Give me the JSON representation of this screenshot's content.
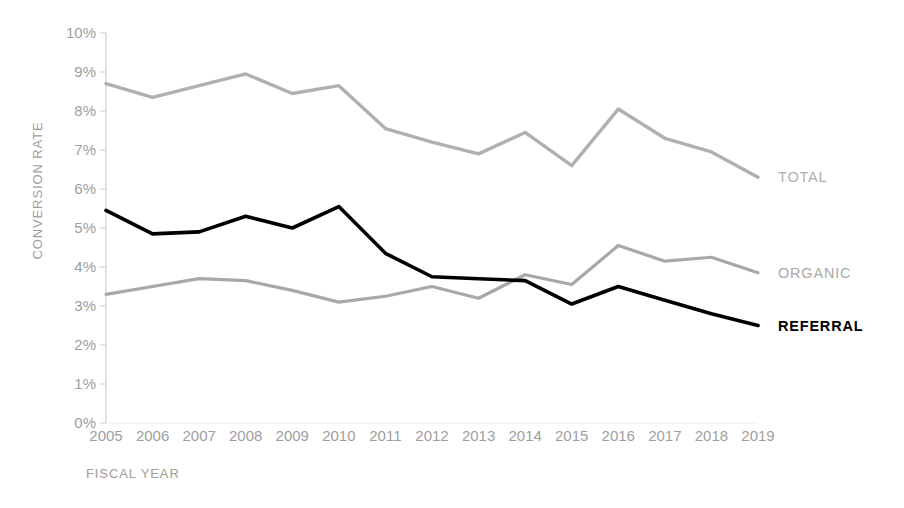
{
  "chart_data": {
    "type": "line",
    "title": "",
    "xlabel": "FISCAL YEAR",
    "ylabel": "CONVERSION RATE",
    "categories": [
      "2005",
      "2006",
      "2007",
      "2008",
      "2009",
      "2010",
      "2011",
      "2012",
      "2013",
      "2014",
      "2015",
      "2016",
      "2017",
      "2018",
      "2019"
    ],
    "x": [
      2005,
      2006,
      2007,
      2008,
      2009,
      2010,
      2011,
      2012,
      2013,
      2014,
      2015,
      2016,
      2017,
      2018,
      2019
    ],
    "ylim": [
      0,
      10
    ],
    "y_tick_labels": [
      "0%",
      "1%",
      "2%",
      "3%",
      "4%",
      "5%",
      "6%",
      "7%",
      "8%",
      "9%",
      "10%"
    ],
    "y_tick_values": [
      0,
      1,
      2,
      3,
      4,
      5,
      6,
      7,
      8,
      9,
      10
    ],
    "y_unit": "%",
    "grid": false,
    "legend_position": "right-inline-end-of-line",
    "series": [
      {
        "name": "TOTAL",
        "color": "#b0b0b0",
        "values": [
          8.7,
          8.35,
          8.65,
          8.95,
          8.45,
          8.65,
          7.55,
          7.2,
          6.9,
          7.45,
          6.6,
          8.05,
          7.3,
          6.95,
          6.3
        ]
      },
      {
        "name": "ORGANIC",
        "color": "#a8a8a8",
        "values": [
          3.3,
          3.5,
          3.7,
          3.65,
          3.4,
          3.1,
          3.25,
          3.5,
          3.2,
          3.8,
          3.55,
          4.55,
          4.15,
          4.25,
          3.85
        ]
      },
      {
        "name": "REFERRAL",
        "color": "#000000",
        "values": [
          5.45,
          4.85,
          4.9,
          5.3,
          5.0,
          5.55,
          4.35,
          3.75,
          3.7,
          3.65,
          3.05,
          3.5,
          3.15,
          2.8,
          2.5
        ]
      }
    ]
  },
  "labels": {
    "y_axis_title": "CONVERSION RATE",
    "x_axis_title": "FISCAL YEAR",
    "series_total": "TOTAL",
    "series_organic": "ORGANIC",
    "series_referral": "REFERRAL"
  },
  "colors": {
    "total": "#b0b0b0",
    "organic": "#a8a8a8",
    "referral": "#000000",
    "axis": "#d8d8d8",
    "tick_text": "#9e9e9e"
  }
}
